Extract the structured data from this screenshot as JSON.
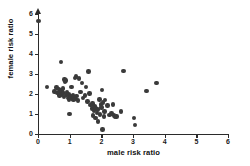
{
  "chart_data": {
    "type": "scatter",
    "title": "",
    "xlabel": "male risk ratio",
    "ylabel": "female risk ratio",
    "xlim": [
      0,
      6
    ],
    "ylim": [
      0,
      6
    ],
    "xticks": [
      0,
      1,
      2,
      3,
      4,
      5,
      6
    ],
    "yticks": [
      0,
      1,
      2,
      3,
      4,
      5,
      6
    ],
    "xtick_labels": [
      "0",
      "1",
      "2",
      "3",
      "4",
      "5",
      "6"
    ],
    "ytick_labels": [
      "0",
      "1",
      "2",
      "3",
      "4",
      "5",
      "6"
    ],
    "grid": false,
    "legend": null,
    "marker": {
      "shape": "circle",
      "color": "#3a3a3a",
      "size_px": 4.4
    },
    "axis_color": "#2b2b2b",
    "background_color": "#ffffff",
    "y_axis_arrow": true,
    "n_points": 78,
    "points": [
      [
        0.02,
        5.65
      ],
      [
        0.28,
        2.35
      ],
      [
        0.52,
        2.12
      ],
      [
        0.58,
        2.32
      ],
      [
        0.62,
        2.05
      ],
      [
        0.66,
        2.22
      ],
      [
        0.68,
        1.92
      ],
      [
        0.7,
        2.08
      ],
      [
        0.72,
        3.6
      ],
      [
        0.74,
        2.18
      ],
      [
        0.76,
        1.98
      ],
      [
        0.78,
        2.28
      ],
      [
        0.8,
        2.05
      ],
      [
        0.82,
        1.85
      ],
      [
        0.84,
        2.72
      ],
      [
        0.86,
        2.62
      ],
      [
        0.88,
        2.68
      ],
      [
        0.9,
        1.95
      ],
      [
        0.92,
        2.1
      ],
      [
        0.94,
        1.8
      ],
      [
        0.96,
        2.0
      ],
      [
        0.98,
        1.72
      ],
      [
        1.0,
        1.0
      ],
      [
        1.02,
        1.88
      ],
      [
        1.06,
        2.35
      ],
      [
        1.08,
        1.78
      ],
      [
        1.1,
        1.95
      ],
      [
        1.12,
        1.7
      ],
      [
        1.14,
        1.82
      ],
      [
        1.16,
        2.8
      ],
      [
        1.18,
        1.75
      ],
      [
        1.2,
        2.88
      ],
      [
        1.22,
        1.9
      ],
      [
        1.26,
        1.68
      ],
      [
        1.3,
        2.78
      ],
      [
        1.34,
        2.1
      ],
      [
        1.38,
        2.55
      ],
      [
        1.42,
        1.8
      ],
      [
        1.48,
        1.92
      ],
      [
        1.52,
        2.35
      ],
      [
        1.56,
        1.62
      ],
      [
        1.6,
        3.12
      ],
      [
        1.62,
        2.02
      ],
      [
        1.66,
        1.45
      ],
      [
        1.7,
        1.28
      ],
      [
        1.72,
        1.52
      ],
      [
        1.74,
        0.92
      ],
      [
        1.76,
        1.18
      ],
      [
        1.78,
        1.4
      ],
      [
        1.8,
        1.35
      ],
      [
        1.82,
        0.8
      ],
      [
        1.84,
        1.3
      ],
      [
        1.86,
        1.05
      ],
      [
        1.88,
        1.22
      ],
      [
        1.9,
        0.62
      ],
      [
        1.94,
        1.72
      ],
      [
        1.96,
        0.98
      ],
      [
        1.98,
        1.48
      ],
      [
        2.0,
        1.32
      ],
      [
        2.02,
        2.2
      ],
      [
        2.04,
        0.22
      ],
      [
        2.06,
        1.58
      ],
      [
        2.08,
        0.88
      ],
      [
        2.1,
        1.12
      ],
      [
        2.12,
        1.7
      ],
      [
        2.2,
        1.42
      ],
      [
        2.26,
        0.95
      ],
      [
        2.32,
        1.02
      ],
      [
        2.36,
        1.48
      ],
      [
        2.4,
        0.92
      ],
      [
        2.44,
        0.85
      ],
      [
        2.48,
        0.88
      ],
      [
        2.62,
        1.12
      ],
      [
        2.7,
        3.15
      ],
      [
        3.04,
        0.8
      ],
      [
        3.06,
        0.45
      ],
      [
        3.42,
        2.15
      ],
      [
        3.74,
        2.55
      ]
    ]
  }
}
